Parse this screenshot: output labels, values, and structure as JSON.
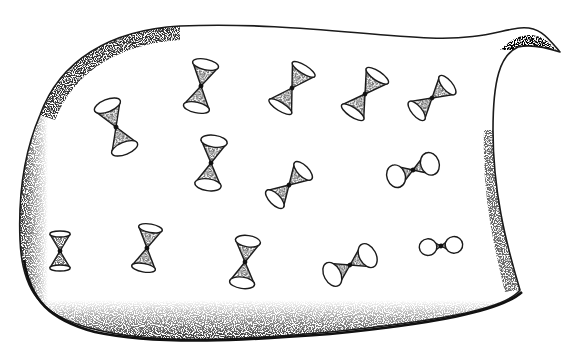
{
  "figure": {
    "ink_color": "#1a1a1a",
    "background": "#ffffff",
    "sheet": {
      "has_horn_upper_right": true
    }
  },
  "light_cones": [
    {
      "id": 1,
      "x": 116,
      "y": 127,
      "angle": -22,
      "size": 46,
      "rim_ratio": 0.45,
      "style": "cone"
    },
    {
      "id": 2,
      "x": 201,
      "y": 86,
      "angle": 12,
      "size": 44,
      "rim_ratio": 0.4,
      "style": "cone"
    },
    {
      "id": 3,
      "x": 292,
      "y": 88,
      "angle": 32,
      "size": 44,
      "rim_ratio": 0.32,
      "style": "cone"
    },
    {
      "id": 4,
      "x": 365,
      "y": 94,
      "angle": 34,
      "size": 44,
      "rim_ratio": 0.35,
      "style": "cone"
    },
    {
      "id": 5,
      "x": 432,
      "y": 98,
      "angle": 50,
      "size": 40,
      "rim_ratio": 0.42,
      "style": "cone"
    },
    {
      "id": 6,
      "x": 211,
      "y": 163,
      "angle": 8,
      "size": 44,
      "rim_ratio": 0.45,
      "style": "cone"
    },
    {
      "id": 7,
      "x": 289,
      "y": 185,
      "angle": 45,
      "size": 40,
      "rim_ratio": 0.45,
      "style": "cone"
    },
    {
      "id": 8,
      "x": 413,
      "y": 170,
      "angle": 70,
      "size": 36,
      "rim_ratio": 0.8,
      "style": "ellipse"
    },
    {
      "id": 9,
      "x": 60,
      "y": 251,
      "angle": 0,
      "size": 34,
      "rim_ratio": 0.3,
      "style": "cone"
    },
    {
      "id": 10,
      "x": 147,
      "y": 248,
      "angle": 10,
      "size": 40,
      "rim_ratio": 0.35,
      "style": "cone"
    },
    {
      "id": 11,
      "x": 245,
      "y": 262,
      "angle": 8,
      "size": 42,
      "rim_ratio": 0.45,
      "style": "cone"
    },
    {
      "id": 12,
      "x": 350,
      "y": 265,
      "angle": 62,
      "size": 40,
      "rim_ratio": 0.65,
      "style": "ellipse"
    },
    {
      "id": 13,
      "x": 441,
      "y": 246,
      "angle": 85,
      "size": 26,
      "rim_ratio": 1.05,
      "style": "ellipse"
    }
  ]
}
